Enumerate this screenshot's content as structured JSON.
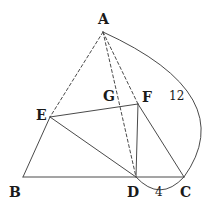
{
  "figure": {
    "kind": "geometry-diagram",
    "background_color": "#ffffff",
    "stroke_color": "#4a4a4a",
    "label_color": "#1a1a1a",
    "width": 208,
    "height": 208,
    "points": [
      {
        "id": "A",
        "label": "A",
        "x": 103,
        "y": 32,
        "label_x": 98,
        "label_y": 12
      },
      {
        "id": "B",
        "label": "B",
        "x": 23,
        "y": 177,
        "label_x": 9,
        "label_y": 185
      },
      {
        "id": "C",
        "label": "C",
        "x": 184,
        "y": 177,
        "label_x": 180,
        "label_y": 185
      },
      {
        "id": "D",
        "label": "D",
        "x": 136,
        "y": 177,
        "label_x": 127,
        "label_y": 185
      },
      {
        "id": "E",
        "label": "E",
        "x": 50,
        "y": 117,
        "label_x": 36,
        "label_y": 108
      },
      {
        "id": "F",
        "label": "F",
        "x": 138,
        "y": 104,
        "label_x": 142,
        "label_y": 90
      },
      {
        "id": "G",
        "label": "G",
        "x": 115,
        "y": 102,
        "label_x": 103,
        "label_y": 89
      }
    ],
    "solid_segments": [
      {
        "name": "segment-BC",
        "from": "B",
        "to": "C"
      },
      {
        "name": "segment-BE",
        "from": "B",
        "to": "E"
      },
      {
        "name": "segment-EF",
        "from": "E",
        "to": "F"
      },
      {
        "name": "segment-ED",
        "from": "E",
        "to": "D"
      },
      {
        "name": "segment-FD",
        "from": "F",
        "to": "D"
      },
      {
        "name": "segment-FC",
        "from": "F",
        "to": "C"
      }
    ],
    "dashed_segments": [
      {
        "name": "cevian-AE",
        "from": "A",
        "to": "E"
      },
      {
        "name": "cevian-AD",
        "from": "A",
        "to": "D"
      },
      {
        "name": "cevian-AF",
        "from": "A",
        "to": "F"
      }
    ],
    "arcs": [
      {
        "name": "arc-A-to-C",
        "from": "A",
        "to": "C",
        "bulge_x": 193,
        "bulge_y": 100,
        "measure_label": "12",
        "label_x": 169,
        "label_y": 90
      },
      {
        "name": "arc-D-to-C",
        "from": "D",
        "to": "C",
        "bulge_x": 160,
        "bulge_y": 190,
        "measure_label": "4",
        "label_x": 155,
        "label_y": 186
      }
    ]
  }
}
